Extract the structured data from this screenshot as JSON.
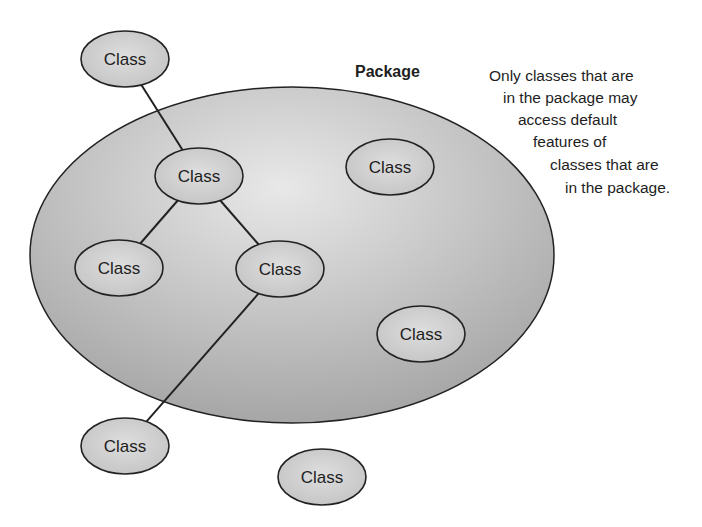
{
  "diagram": {
    "package": {
      "label": "Package",
      "cx": 292,
      "cy": 255,
      "rx": 262,
      "ry": 168,
      "fill_center": "#e6e6e6",
      "fill_edge": "#a9a9a9"
    },
    "note_lines": [
      "Only classes that are",
      "in the package may",
      "access default",
      "features of",
      "classes that are",
      "in the package."
    ],
    "class_fill": "#d4d4d4",
    "stroke": "#222222",
    "classes": [
      {
        "id": "class-top",
        "label": "Class",
        "cx": 125,
        "cy": 59,
        "inside": false
      },
      {
        "id": "class-middle",
        "label": "Class",
        "cx": 199,
        "cy": 176,
        "inside": true
      },
      {
        "id": "class-left",
        "label": "Class",
        "cx": 119,
        "cy": 268,
        "inside": true
      },
      {
        "id": "class-center",
        "label": "Class",
        "cx": 280,
        "cy": 269,
        "inside": true
      },
      {
        "id": "class-right-top",
        "label": "Class",
        "cx": 390,
        "cy": 167,
        "inside": true
      },
      {
        "id": "class-right-bottom",
        "label": "Class",
        "cx": 421,
        "cy": 334,
        "inside": true
      },
      {
        "id": "class-bottom-left",
        "label": "Class",
        "cx": 125,
        "cy": 446,
        "inside": false
      },
      {
        "id": "class-bottom",
        "label": "Class",
        "cx": 322,
        "cy": 477,
        "inside": false
      }
    ],
    "connections": [
      {
        "from": "class-top",
        "to": "class-middle"
      },
      {
        "from": "class-middle",
        "to": "class-left"
      },
      {
        "from": "class-middle",
        "to": "class-center"
      },
      {
        "from": "class-center",
        "to": "class-bottom-left"
      }
    ]
  }
}
